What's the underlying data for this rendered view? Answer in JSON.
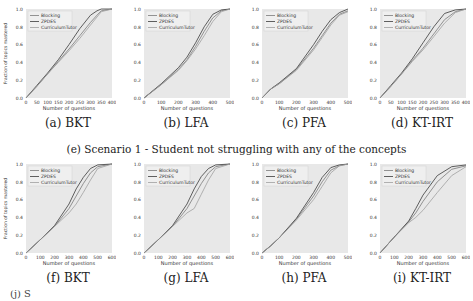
{
  "figure": {
    "row1_caption": "(e) Scenario 1 - Student not struggling with any of the concepts",
    "row2_caption_fragment": "(j) S",
    "legend": [
      "Blocking",
      "ZPDES",
      "CurriculumTutor"
    ],
    "ylabel": "Fraction of topics mastered",
    "xlabel": "Number of questions"
  },
  "colors": {
    "plot_bg": "#e8e8e8",
    "blocking": "#7a7a7a",
    "zpdes": "#3a3a3a",
    "curriculumtutor": "#a0a0a0"
  },
  "chart_data": [
    {
      "type": "line",
      "caption": "(a) BKT",
      "title": "",
      "xlabel": "Number of questions",
      "ylabel": "Fraction of topics mastered",
      "xlim": [
        0,
        400
      ],
      "ylim": [
        0,
        1.0
      ],
      "xticks": [
        0,
        50,
        100,
        150,
        200,
        250,
        300,
        350,
        400
      ],
      "yticks": [
        0.0,
        0.2,
        0.4,
        0.6,
        0.8,
        1.0
      ],
      "grid": false,
      "legend_position": "upper left",
      "series": [
        {
          "name": "Blocking",
          "x": [
            0,
            50,
            100,
            150,
            200,
            250,
            300,
            330,
            350,
            400
          ],
          "y": [
            0,
            0.13,
            0.27,
            0.41,
            0.55,
            0.7,
            0.85,
            0.93,
            0.98,
            1.0
          ]
        },
        {
          "name": "ZPDES",
          "x": [
            0,
            50,
            100,
            150,
            200,
            250,
            300,
            330,
            350,
            400
          ],
          "y": [
            0,
            0.14,
            0.28,
            0.43,
            0.6,
            0.78,
            0.93,
            0.98,
            1.0,
            1.0
          ]
        },
        {
          "name": "CurriculumTutor",
          "x": [
            0,
            50,
            100,
            150,
            200,
            250,
            300,
            330,
            350,
            400
          ],
          "y": [
            0,
            0.13,
            0.27,
            0.4,
            0.53,
            0.67,
            0.82,
            0.91,
            0.97,
            1.0
          ]
        }
      ]
    },
    {
      "type": "line",
      "caption": "(b) LFA",
      "title": "",
      "xlabel": "Number of questions",
      "ylabel": "",
      "xlim": [
        0,
        500
      ],
      "ylim": [
        0,
        1.0
      ],
      "xticks": [
        0,
        100,
        200,
        300,
        400,
        500
      ],
      "yticks": [
        0.0,
        0.2,
        0.4,
        0.6,
        0.8,
        1.0
      ],
      "grid": false,
      "legend_position": "upper left",
      "series": [
        {
          "name": "Blocking",
          "x": [
            0,
            100,
            200,
            250,
            300,
            350,
            400,
            450,
            500
          ],
          "y": [
            0,
            0.15,
            0.32,
            0.43,
            0.58,
            0.75,
            0.9,
            0.98,
            1.0
          ]
        },
        {
          "name": "ZPDES",
          "x": [
            0,
            100,
            200,
            250,
            300,
            350,
            400,
            450,
            500
          ],
          "y": [
            0,
            0.16,
            0.34,
            0.46,
            0.62,
            0.8,
            0.94,
            0.99,
            1.0
          ]
        },
        {
          "name": "CurriculumTutor",
          "x": [
            0,
            100,
            200,
            250,
            300,
            350,
            400,
            450,
            500
          ],
          "y": [
            0,
            0.15,
            0.31,
            0.42,
            0.55,
            0.7,
            0.86,
            0.97,
            1.0
          ]
        }
      ]
    },
    {
      "type": "line",
      "caption": "(c) PFA",
      "title": "",
      "xlabel": "Number of questions",
      "ylabel": "",
      "xlim": [
        0,
        500
      ],
      "ylim": [
        0,
        1.0
      ],
      "xticks": [
        0,
        100,
        200,
        300,
        400,
        500
      ],
      "yticks": [
        0.0,
        0.2,
        0.4,
        0.6,
        0.8,
        1.0
      ],
      "grid": false,
      "legend_position": "upper left",
      "series": [
        {
          "name": "Blocking",
          "x": [
            0,
            50,
            100,
            200,
            300,
            350,
            400,
            450,
            500
          ],
          "y": [
            0,
            0.1,
            0.16,
            0.32,
            0.56,
            0.7,
            0.84,
            0.94,
            0.98
          ]
        },
        {
          "name": "ZPDES",
          "x": [
            0,
            50,
            100,
            200,
            300,
            350,
            400,
            450,
            500
          ],
          "y": [
            0,
            0.1,
            0.17,
            0.33,
            0.6,
            0.75,
            0.88,
            0.96,
            1.0
          ]
        },
        {
          "name": "CurriculumTutor",
          "x": [
            0,
            50,
            100,
            200,
            300,
            350,
            400,
            450,
            500
          ],
          "y": [
            0,
            0.1,
            0.16,
            0.31,
            0.54,
            0.68,
            0.82,
            0.93,
            0.97
          ]
        }
      ]
    },
    {
      "type": "line",
      "caption": "(d) KT-IRT",
      "title": "",
      "xlabel": "Number of questions",
      "ylabel": "",
      "xlim": [
        0,
        400
      ],
      "ylim": [
        0,
        1.0
      ],
      "xticks": [
        0,
        50,
        100,
        150,
        200,
        250,
        300,
        350,
        400
      ],
      "yticks": [
        0.0,
        0.2,
        0.4,
        0.6,
        0.8,
        1.0
      ],
      "grid": false,
      "legend_position": "upper left",
      "series": [
        {
          "name": "Blocking",
          "x": [
            0,
            50,
            100,
            150,
            200,
            250,
            300,
            350,
            400
          ],
          "y": [
            0,
            0.13,
            0.27,
            0.42,
            0.56,
            0.72,
            0.88,
            0.97,
            1.0
          ]
        },
        {
          "name": "ZPDES",
          "x": [
            0,
            50,
            100,
            150,
            200,
            250,
            300,
            350,
            400
          ],
          "y": [
            0,
            0.14,
            0.28,
            0.44,
            0.62,
            0.8,
            0.95,
            0.99,
            1.0
          ]
        },
        {
          "name": "CurriculumTutor",
          "x": [
            0,
            50,
            100,
            150,
            200,
            250,
            300,
            350,
            400
          ],
          "y": [
            0,
            0.13,
            0.27,
            0.41,
            0.54,
            0.69,
            0.84,
            0.96,
            1.0
          ]
        }
      ]
    },
    {
      "type": "line",
      "caption": "(f) BKT",
      "title": "",
      "xlabel": "Number of questions",
      "ylabel": "Fraction of topics mastered",
      "xlim": [
        0,
        600
      ],
      "ylim": [
        0,
        1.0
      ],
      "xticks": [
        0,
        100,
        200,
        300,
        400,
        500,
        600
      ],
      "yticks": [
        0.0,
        0.2,
        0.4,
        0.6,
        0.8,
        1.0
      ],
      "grid": false,
      "legend_position": "upper left",
      "series": [
        {
          "name": "Blocking",
          "x": [
            0,
            100,
            200,
            300,
            350,
            400,
            450,
            500,
            600
          ],
          "y": [
            0,
            0.15,
            0.3,
            0.5,
            0.64,
            0.78,
            0.9,
            0.97,
            1.0
          ]
        },
        {
          "name": "ZPDES",
          "x": [
            0,
            100,
            200,
            300,
            350,
            400,
            450,
            500,
            600
          ],
          "y": [
            0,
            0.15,
            0.31,
            0.55,
            0.72,
            0.85,
            0.95,
            0.99,
            1.0
          ]
        },
        {
          "name": "CurriculumTutor",
          "x": [
            0,
            100,
            200,
            300,
            350,
            400,
            450,
            500,
            600
          ],
          "y": [
            0,
            0.15,
            0.3,
            0.45,
            0.55,
            0.68,
            0.82,
            0.95,
            1.0
          ]
        }
      ]
    },
    {
      "type": "line",
      "caption": "(g) LFA",
      "title": "",
      "xlabel": "Number of questions",
      "ylabel": "",
      "xlim": [
        0,
        600
      ],
      "ylim": [
        0,
        1.0
      ],
      "xticks": [
        0,
        100,
        200,
        300,
        400,
        500,
        600
      ],
      "yticks": [
        0.0,
        0.2,
        0.4,
        0.6,
        0.8,
        1.0
      ],
      "grid": false,
      "legend_position": "upper left",
      "series": [
        {
          "name": "Blocking",
          "x": [
            0,
            100,
            200,
            300,
            350,
            400,
            450,
            500,
            600
          ],
          "y": [
            0,
            0.15,
            0.3,
            0.5,
            0.64,
            0.78,
            0.9,
            0.97,
            1.0
          ]
        },
        {
          "name": "ZPDES",
          "x": [
            0,
            100,
            200,
            300,
            350,
            400,
            450,
            500,
            600
          ],
          "y": [
            0,
            0.15,
            0.31,
            0.55,
            0.72,
            0.86,
            0.95,
            0.99,
            1.0
          ]
        },
        {
          "name": "CurriculumTutor",
          "x": [
            0,
            100,
            200,
            300,
            350,
            400,
            450,
            500,
            600
          ],
          "y": [
            0,
            0.15,
            0.3,
            0.45,
            0.5,
            0.66,
            0.82,
            0.95,
            1.0
          ]
        }
      ]
    },
    {
      "type": "line",
      "caption": "(h) PFA",
      "title": "",
      "xlabel": "Number of questions",
      "ylabel": "",
      "xlim": [
        0,
        500
      ],
      "ylim": [
        0,
        1.0
      ],
      "xticks": [
        0,
        100,
        200,
        300,
        400,
        500
      ],
      "yticks": [
        0.0,
        0.2,
        0.4,
        0.6,
        0.8,
        1.0
      ],
      "grid": false,
      "legend_position": "upper left",
      "series": [
        {
          "name": "Blocking",
          "x": [
            0,
            50,
            100,
            200,
            300,
            350,
            400,
            450,
            500
          ],
          "y": [
            0,
            0.08,
            0.17,
            0.38,
            0.64,
            0.8,
            0.93,
            0.98,
            1.0
          ]
        },
        {
          "name": "ZPDES",
          "x": [
            0,
            50,
            100,
            200,
            300,
            350,
            400,
            450,
            500
          ],
          "y": [
            0,
            0.08,
            0.17,
            0.39,
            0.68,
            0.85,
            0.96,
            0.99,
            1.0
          ]
        },
        {
          "name": "CurriculumTutor",
          "x": [
            0,
            50,
            100,
            200,
            300,
            350,
            400,
            450,
            500
          ],
          "y": [
            0,
            0.08,
            0.17,
            0.37,
            0.6,
            0.75,
            0.9,
            0.98,
            1.0
          ]
        }
      ]
    },
    {
      "type": "line",
      "caption": "(i) KT-IRT",
      "title": "",
      "xlabel": "Number of questions",
      "ylabel": "",
      "xlim": [
        0,
        600
      ],
      "ylim": [
        0,
        1.0
      ],
      "xticks": [
        0,
        100,
        200,
        300,
        400,
        500,
        600
      ],
      "yticks": [
        0.0,
        0.2,
        0.4,
        0.6,
        0.8,
        1.0
      ],
      "grid": false,
      "legend_position": "upper left",
      "series": [
        {
          "name": "Blocking",
          "x": [
            0,
            100,
            200,
            250,
            300,
            400,
            500,
            600
          ],
          "y": [
            0,
            0.18,
            0.35,
            0.45,
            0.58,
            0.8,
            0.94,
            0.98
          ]
        },
        {
          "name": "ZPDES",
          "x": [
            0,
            100,
            200,
            250,
            300,
            400,
            500,
            600
          ],
          "y": [
            0,
            0.18,
            0.36,
            0.5,
            0.65,
            0.87,
            0.97,
            0.99
          ]
        },
        {
          "name": "CurriculumTutor",
          "x": [
            0,
            100,
            200,
            250,
            300,
            400,
            500,
            600
          ],
          "y": [
            0,
            0.18,
            0.34,
            0.4,
            0.48,
            0.68,
            0.87,
            0.97
          ]
        }
      ]
    }
  ]
}
